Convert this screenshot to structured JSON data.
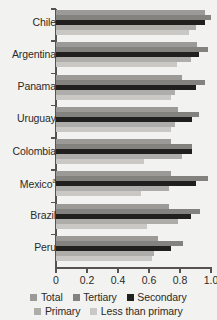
{
  "chart_data": {
    "type": "bar",
    "orientation": "horizontal",
    "title": "",
    "subtitle": "",
    "xlabel": "",
    "ylabel": "",
    "xlim": [
      0,
      1.0
    ],
    "xticks": [
      0,
      0.2,
      0.4,
      0.6,
      0.8,
      1.0
    ],
    "xtick_labels": [
      "0",
      "0.2",
      "0.4",
      "0.6",
      "0.8",
      "1.0"
    ],
    "grid": false,
    "legend_position": "bottom",
    "categories": [
      "Chile",
      "Argentina",
      "Panama",
      "Uruguay",
      "Colombia",
      "Mexico",
      "Brazil",
      "Peru"
    ],
    "category_labels": [
      "Chile",
      "Argentina",
      "Panama",
      "Uruguay",
      "Colombia",
      "Mexicoᵃ",
      "Brazil",
      "Peru"
    ],
    "category_footnotes": {
      "Mexico": "a"
    },
    "series": [
      {
        "name": "Total",
        "color": "#9b9a96",
        "values": [
          0.96,
          0.91,
          0.81,
          0.79,
          0.74,
          0.74,
          0.73,
          0.66
        ]
      },
      {
        "name": "Tertiary",
        "color": "#83827e",
        "values": [
          1.0,
          0.98,
          0.96,
          0.92,
          0.88,
          0.98,
          0.93,
          0.82
        ]
      },
      {
        "name": "Secondary",
        "color": "#22201e",
        "values": [
          0.96,
          0.92,
          0.9,
          0.88,
          0.88,
          0.9,
          0.87,
          0.74
        ]
      },
      {
        "name": "Primary",
        "color": "#aeada9",
        "values": [
          0.9,
          0.87,
          0.77,
          0.77,
          0.81,
          0.73,
          0.79,
          0.63
        ]
      },
      {
        "name": "Less than primary",
        "color": "#c9c8c4",
        "values": [
          0.86,
          0.78,
          0.74,
          0.74,
          0.57,
          0.55,
          0.59,
          0.62
        ]
      }
    ]
  },
  "legend": {
    "rows": [
      [
        {
          "label": "Total",
          "color": "#9b9a96"
        },
        {
          "label": "Tertiary",
          "color": "#83827e"
        },
        {
          "label": "Secondary",
          "color": "#22201e"
        }
      ],
      [
        {
          "label": "Primary",
          "color": "#aeada9"
        },
        {
          "label": "Less than primary",
          "color": "#c9c8c4"
        }
      ]
    ]
  },
  "style": {
    "background": "#f2f2f0",
    "axis_color": "#55524f",
    "text_color": "#2b2a28"
  }
}
